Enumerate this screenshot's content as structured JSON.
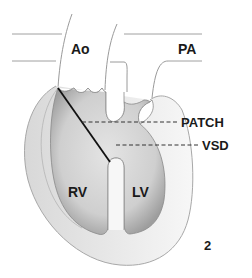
{
  "figure": {
    "number": "2",
    "labels": {
      "aorta": "Ao",
      "pulmonary_artery": "PA",
      "patch": "PATCH",
      "vsd": "VSD",
      "right_ventricle": "RV",
      "left_ventricle": "LV"
    },
    "colors": {
      "outline": "#9a9a9a",
      "cavity": "#c8c8c8",
      "cavity_edge": "#8a8a8a",
      "text": "#1a1a1a",
      "patch_line": "#111111"
    }
  }
}
